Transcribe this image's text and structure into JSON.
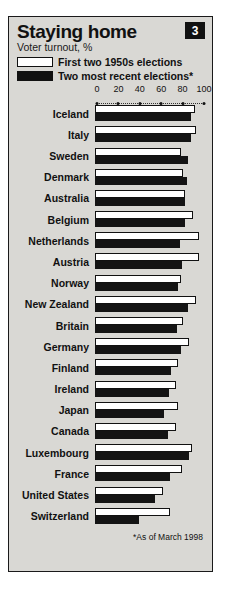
{
  "header": {
    "title": "Staying home",
    "subtitle": "Voter turnout, %",
    "badge": "3"
  },
  "legend": [
    {
      "key": "first_1950s",
      "label": "First two 1950s elections",
      "style": "white"
    },
    {
      "key": "recent",
      "label": "Two most recent elections*",
      "style": "black"
    }
  ],
  "footnote": "*As of March 1998",
  "chart_data": {
    "type": "bar",
    "orientation": "horizontal",
    "title": "Staying home",
    "subtitle": "Voter turnout, %",
    "xlabel": "",
    "ylabel": "",
    "xlim": [
      0,
      100
    ],
    "ticks": [
      0,
      20,
      40,
      60,
      80,
      100
    ],
    "grid": false,
    "legend_position": "top",
    "categories": [
      "Iceland",
      "Italy",
      "Sweden",
      "Denmark",
      "Australia",
      "Belgium",
      "Netherlands",
      "Austria",
      "Norway",
      "New Zealand",
      "Britain",
      "Germany",
      "Finland",
      "Ireland",
      "Japan",
      "Canada",
      "Luxembourg",
      "France",
      "United States",
      "Switzerland"
    ],
    "series": [
      {
        "name": "First two 1950s elections",
        "color": "#ffffff",
        "values": [
          92,
          93,
          79,
          81,
          83,
          90,
          95,
          95,
          79,
          93,
          81,
          86,
          76,
          74,
          76,
          74,
          89,
          80,
          62,
          69
        ]
      },
      {
        "name": "Two most recent elections*",
        "color": "#141414",
        "values": [
          88,
          88,
          85,
          84,
          83,
          83,
          78,
          80,
          76,
          85,
          75,
          79,
          70,
          68,
          63,
          67,
          86,
          69,
          55,
          40
        ]
      }
    ]
  }
}
